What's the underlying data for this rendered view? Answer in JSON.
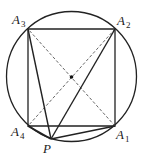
{
  "diagram": {
    "title": "",
    "circle": {
      "cx": 71.5,
      "cy": 76.5,
      "r": 65
    },
    "center_point": {
      "x": 71.5,
      "y": 77
    },
    "points": {
      "A1": {
        "x": 115,
        "y": 126
      },
      "A2": {
        "x": 115,
        "y": 29
      },
      "A3": {
        "x": 28,
        "y": 29
      },
      "A4": {
        "x": 28,
        "y": 126
      },
      "P": {
        "x": 51,
        "y": 139
      }
    },
    "labels": [
      {
        "id": "A1",
        "main": "A",
        "sub": "1"
      },
      {
        "id": "A2",
        "main": "A",
        "sub": "2"
      },
      {
        "id": "A3",
        "main": "A",
        "sub": "3"
      },
      {
        "id": "A4",
        "main": "A",
        "sub": "4"
      },
      {
        "id": "P",
        "main": "P",
        "sub": ""
      }
    ],
    "solid_segments": [
      "A1A2",
      "A2A3",
      "A3A4",
      "A4A1",
      "PA1",
      "PA2",
      "PA3",
      "PA4"
    ],
    "dashed_segments": [
      "A1A3",
      "A2A4"
    ],
    "colors": {
      "stroke": "#222222",
      "dashed": "#555555",
      "background": "#ffffff"
    }
  }
}
